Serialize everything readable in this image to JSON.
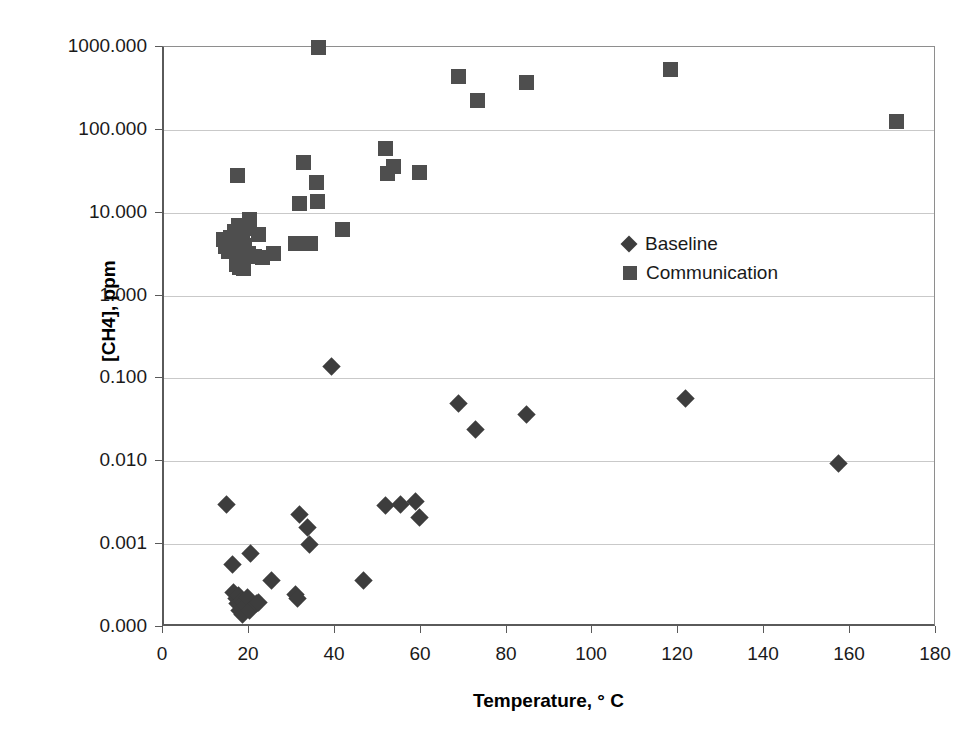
{
  "chart_data": {
    "type": "scatter",
    "title": "",
    "xlabel": "Temperature, ° C",
    "ylabel": "[CH4], ppm",
    "xlim": [
      0,
      180
    ],
    "ylim": [
      0.0001,
      1000
    ],
    "yscale": "log",
    "grid": "horizontal",
    "legend_position": "center-right-inside",
    "xticks": [
      "0",
      "20",
      "40",
      "60",
      "80",
      "100",
      "120",
      "140",
      "160",
      "180"
    ],
    "xtick_values": [
      0,
      20,
      40,
      60,
      80,
      100,
      120,
      140,
      160,
      180
    ],
    "yticks": [
      "1000.000",
      "100.000",
      "10.000",
      "1.000",
      "0.100",
      "0.010",
      "0.001",
      "0.000"
    ],
    "ytick_values": [
      1000,
      100,
      10,
      1,
      0.1,
      0.01,
      0.001,
      0.0001
    ],
    "series": [
      {
        "name": "Baseline",
        "marker": "diamond",
        "color": "#3d3d3d",
        "points": [
          [
            14.5,
            0.003
          ],
          [
            16.0,
            0.00057
          ],
          [
            16.2,
            0.00026
          ],
          [
            16.8,
            0.00022
          ],
          [
            17.0,
            0.00019
          ],
          [
            17.4,
            0.00024
          ],
          [
            17.6,
            0.00016
          ],
          [
            18.0,
            0.00021
          ],
          [
            18.3,
            0.00014
          ],
          [
            18.6,
            0.0002
          ],
          [
            19.0,
            0.00018
          ],
          [
            19.4,
            0.00023
          ],
          [
            19.8,
            0.00016
          ],
          [
            20.2,
            0.00078
          ],
          [
            21.5,
            0.00019
          ],
          [
            22.0,
            0.0002
          ],
          [
            25.0,
            0.00036
          ],
          [
            30.5,
            0.00025
          ],
          [
            31.0,
            0.00022
          ],
          [
            31.5,
            0.0023
          ],
          [
            33.5,
            0.0016
          ],
          [
            33.8,
            0.00098
          ],
          [
            39.0,
            0.14
          ],
          [
            46.5,
            0.00036
          ],
          [
            51.5,
            0.0029
          ],
          [
            55.0,
            0.003
          ],
          [
            58.5,
            0.0033
          ],
          [
            59.5,
            0.0021
          ],
          [
            68.5,
            0.05
          ],
          [
            72.5,
            0.024
          ],
          [
            84.5,
            0.037
          ],
          [
            121.5,
            0.057
          ],
          [
            157.0,
            0.0094
          ]
        ]
      },
      {
        "name": "Communication",
        "marker": "square",
        "color": "#4e4e4e",
        "points": [
          [
            13.8,
            4.8
          ],
          [
            14.2,
            3.9
          ],
          [
            15.0,
            3.4
          ],
          [
            15.5,
            5.0
          ],
          [
            16.0,
            4.4
          ],
          [
            16.4,
            6.0
          ],
          [
            16.8,
            2.4
          ],
          [
            17.0,
            5.5
          ],
          [
            17.3,
            7.0
          ],
          [
            17.6,
            2.2
          ],
          [
            17.9,
            3.0
          ],
          [
            18.2,
            5.8
          ],
          [
            18.5,
            2.1
          ],
          [
            18.8,
            4.0
          ],
          [
            19.2,
            6.5
          ],
          [
            19.6,
            3.2
          ],
          [
            20.0,
            8.2
          ],
          [
            21.0,
            3.0
          ],
          [
            22.0,
            5.5
          ],
          [
            23.0,
            2.9
          ],
          [
            17.0,
            28.0
          ],
          [
            25.5,
            3.2
          ],
          [
            30.5,
            4.3
          ],
          [
            31.5,
            13.0
          ],
          [
            32.5,
            40.0
          ],
          [
            34.0,
            4.2
          ],
          [
            35.5,
            23.0
          ],
          [
            35.8,
            13.5
          ],
          [
            36.0,
            980.0
          ],
          [
            41.5,
            6.3
          ],
          [
            51.5,
            60.0
          ],
          [
            52.0,
            30.0
          ],
          [
            53.5,
            36.0
          ],
          [
            59.5,
            31.0
          ],
          [
            68.5,
            440.0
          ],
          [
            73.0,
            225.0
          ],
          [
            84.5,
            370.0
          ],
          [
            118.0,
            530.0
          ],
          [
            170.5,
            125.0
          ]
        ]
      }
    ]
  }
}
